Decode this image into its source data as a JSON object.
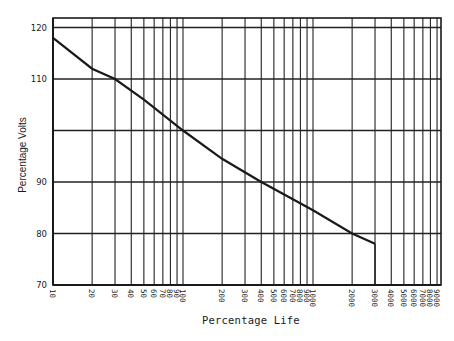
{
  "chart_data": {
    "type": "line",
    "title": "",
    "xlabel": "Percentage Life",
    "ylabel": "Percentage Volts",
    "xscale": "log",
    "xlim": [
      10,
      10000
    ],
    "ylim": [
      70,
      122
    ],
    "grid": true,
    "x_tick_labels": [
      "10",
      "20",
      "30",
      "40",
      "50",
      "60",
      "70",
      "80",
      "90",
      "100",
      "200",
      "300",
      "400",
      "500",
      "600",
      "700",
      "800",
      "900",
      "1000",
      "2000",
      "3000",
      "4000",
      "5000",
      "6000",
      "7000",
      "8000",
      "9000"
    ],
    "x_ticks": [
      10,
      20,
      30,
      40,
      50,
      60,
      70,
      80,
      90,
      100,
      200,
      300,
      400,
      500,
      600,
      700,
      800,
      900,
      1000,
      2000,
      3000,
      4000,
      5000,
      6000,
      7000,
      8000,
      9000
    ],
    "y_ticks": [
      70,
      80,
      90,
      100,
      110,
      120
    ],
    "y_tick_labels": [
      "70",
      "80",
      "90",
      "",
      "110",
      "120"
    ],
    "series": [
      {
        "name": "Voltage vs Life",
        "x": [
          10,
          20,
          30,
          50,
          100,
          200,
          400,
          1000,
          2000,
          3000
        ],
        "y": [
          118,
          112,
          110,
          106,
          100,
          94.5,
          90,
          84.5,
          80,
          78
        ]
      }
    ]
  },
  "labels": {
    "xlabel": "Percentage Life",
    "ylabel": "Percentage Volts"
  }
}
